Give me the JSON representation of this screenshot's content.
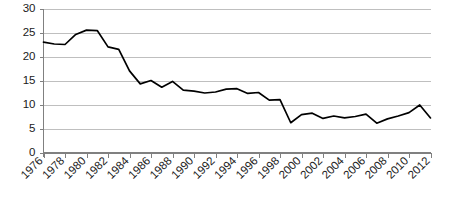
{
  "chart_data": {
    "type": "line",
    "title": "",
    "subtitle": "",
    "xlabel": "",
    "ylabel": "",
    "xlim": [
      1976,
      2012
    ],
    "ylim": [
      0,
      30
    ],
    "y_ticks": [
      0,
      5,
      10,
      15,
      20,
      25,
      30
    ],
    "x_ticks": [
      1976,
      1978,
      1980,
      1982,
      1984,
      1986,
      1988,
      1990,
      1992,
      1994,
      1996,
      1998,
      2000,
      2002,
      2004,
      2006,
      2008,
      2010,
      2012
    ],
    "x_tick_labels": [
      "1976",
      "1978",
      "1980",
      "1982",
      "1984",
      "1986",
      "1988",
      "1990",
      "1992",
      "1994",
      "1996",
      "1998",
      "2000",
      "2002",
      "2004",
      "2006",
      "2008",
      "2010",
      "2012"
    ],
    "y_tick_labels": [
      "0",
      "5",
      "10",
      "15",
      "20",
      "25",
      "30"
    ],
    "grid": true,
    "grid_axis": "y",
    "legend": false,
    "legend_position": "none",
    "line_color": "#000000",
    "grid_color": "#bfbfbf",
    "axis_color": "#808080",
    "x": [
      1976,
      1977,
      1978,
      1979,
      1980,
      1981,
      1982,
      1983,
      1984,
      1985,
      1986,
      1987,
      1988,
      1989,
      1990,
      1991,
      1992,
      1993,
      1994,
      1995,
      1996,
      1997,
      1998,
      1999,
      2000,
      2001,
      2002,
      2003,
      2004,
      2005,
      2006,
      2007,
      2008,
      2009,
      2010,
      2011,
      2012
    ],
    "values": [
      23.0,
      22.6,
      22.5,
      24.6,
      25.5,
      25.4,
      22.0,
      21.5,
      17.0,
      14.3,
      15.0,
      13.6,
      14.8,
      13.0,
      12.8,
      12.4,
      12.6,
      13.2,
      13.3,
      12.3,
      12.5,
      10.9,
      11.0,
      6.2,
      7.9,
      8.2,
      7.1,
      7.6,
      7.2,
      7.5,
      8.0,
      6.1,
      7.0,
      7.6,
      8.3,
      9.9,
      7.2
    ],
    "series": [
      {
        "name": "series-1",
        "values": [
          23.0,
          22.6,
          22.5,
          24.6,
          25.5,
          25.4,
          22.0,
          21.5,
          17.0,
          14.3,
          15.0,
          13.6,
          14.8,
          13.0,
          12.8,
          12.4,
          12.6,
          13.2,
          13.3,
          12.3,
          12.5,
          10.9,
          11.0,
          6.2,
          7.9,
          8.2,
          7.1,
          7.6,
          7.2,
          7.5,
          8.0,
          6.1,
          7.0,
          7.6,
          8.3,
          9.9,
          7.2
        ]
      }
    ]
  }
}
